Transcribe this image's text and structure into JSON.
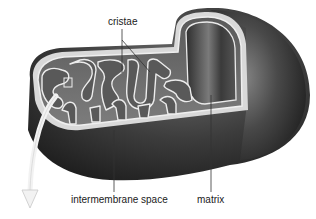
{
  "diagram": {
    "labels": {
      "cristae": "cristae",
      "intermembrane_space": "intermembrane space",
      "matrix": "matrix"
    },
    "colors": {
      "background": "#ffffff",
      "outer_body_dark": "#2a2a2a",
      "outer_body_mid": "#555555",
      "membrane_light": "#e6e6e6",
      "interior": "#6b6b6b",
      "arrow": "#eeeeee",
      "leader_line": "#333333"
    }
  }
}
